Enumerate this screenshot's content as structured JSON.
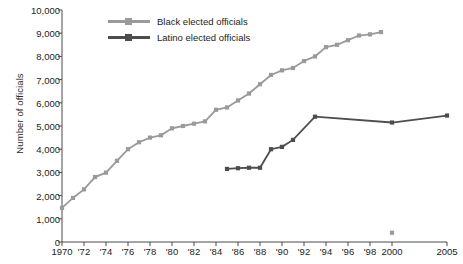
{
  "chart_data": {
    "type": "line",
    "title": "",
    "xlabel": "",
    "ylabel": "Number of officials",
    "xlim": [
      1970,
      2005
    ],
    "ylim": [
      0,
      10000
    ],
    "grid": false,
    "legend_position": "top-left",
    "x_ticks": [
      "1970",
      "'72",
      "'74",
      "'76",
      "'78",
      "'80",
      "'82",
      "'84",
      "'86",
      "'88",
      "'90",
      "'92",
      "'94",
      "'96",
      "'98",
      "2000",
      "2005"
    ],
    "x_tick_values": [
      1970,
      1972,
      1974,
      1976,
      1978,
      1980,
      1982,
      1984,
      1986,
      1988,
      1990,
      1992,
      1994,
      1996,
      1998,
      2000,
      2005
    ],
    "y_ticks": [
      "0",
      "1,000",
      "2,000",
      "3,000",
      "4,000",
      "5,000",
      "6,000",
      "7,000",
      "8,000",
      "9,000",
      "10,000"
    ],
    "y_tick_values": [
      0,
      1000,
      2000,
      3000,
      4000,
      5000,
      6000,
      7000,
      8000,
      9000,
      10000
    ],
    "series": [
      {
        "name": "Black elected officials",
        "color": "#9a9a9a",
        "marker": "square",
        "x": [
          1970,
          1971,
          1972,
          1973,
          1974,
          1975,
          1976,
          1977,
          1978,
          1979,
          1980,
          1981,
          1982,
          1983,
          1984,
          1985,
          1986,
          1987,
          1988,
          1989,
          1990,
          1991,
          1992,
          1993,
          1994,
          1995,
          1996,
          1997,
          1998,
          1999
        ],
        "values": [
          1470,
          1900,
          2270,
          2800,
          2990,
          3500,
          4000,
          4300,
          4500,
          4600,
          4900,
          5000,
          5100,
          5200,
          5700,
          5800,
          6100,
          6400,
          6800,
          7200,
          7400,
          7500,
          7800,
          8000,
          8400,
          8500,
          8700,
          8900,
          8950,
          9050
        ]
      },
      {
        "name": "Latino elected officials",
        "color": "#4d4d4d",
        "marker": "square",
        "x": [
          1985,
          1986,
          1987,
          1988,
          1989,
          1990,
          1991,
          1993,
          2000,
          2005
        ],
        "values": [
          3150,
          3180,
          3200,
          3200,
          4000,
          4100,
          4400,
          5400,
          5150,
          5450
        ]
      },
      {
        "name": "Black elected officials isolated point",
        "color": "#9a9a9a",
        "marker": "square",
        "x": [
          2000
        ],
        "values": [
          400
        ]
      }
    ]
  },
  "axis": {
    "y_title": "Number of officials"
  },
  "legend": {
    "items": [
      {
        "label": "Black elected officials",
        "color": "#9a9a9a"
      },
      {
        "label": "Latino elected officials",
        "color": "#4d4d4d"
      }
    ]
  }
}
